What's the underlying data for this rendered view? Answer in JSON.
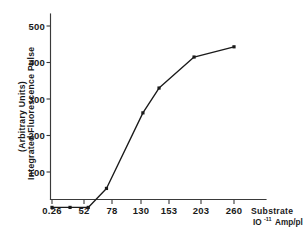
{
  "chart_data": {
    "type": "line",
    "title": "",
    "xlabel": "Substrate 10⁻¹¹ Amp/pl",
    "xlabel_line1": "Substrate",
    "xlabel_line2_base": "IO",
    "xlabel_line2_exp": "-11",
    "xlabel_line2_rest": "Amp/pl",
    "ylabel": "Integrated Fluorescence Pulse (Arbitrary Units)",
    "ylabel_line1": "(Arbitrary Units)",
    "ylabel_line2": "Integrated  Fluorescence  Pulse",
    "xlim": [
      0,
      290
    ],
    "ylim": [
      0,
      520
    ],
    "grid": false,
    "legend": "none",
    "x_tick_labels": [
      "0.26",
      "52",
      "78",
      "130",
      "153",
      "203",
      "260"
    ],
    "x_tick_positions": [
      0.26,
      52,
      78,
      130,
      153,
      203,
      260
    ],
    "y_tick_labels": [
      "100",
      "200",
      "300",
      "400",
      "500"
    ],
    "y_tick_values": [
      100,
      200,
      300,
      400,
      500
    ],
    "marker": "square",
    "line_color": "#1a1a1a",
    "marker_color": "#1a1a1a",
    "series": [
      {
        "name": "Integrated Fluorescence Pulse",
        "x": [
          0.26,
          26,
          52,
          78,
          130,
          153,
          203,
          260
        ],
        "values": [
          3,
          3,
          3,
          55,
          262,
          330,
          415,
          443
        ]
      }
    ]
  },
  "axes": {
    "y_axis_name": "integrated-fluorescence-pulse-axis",
    "x_axis_name": "substrate-concentration-axis"
  }
}
